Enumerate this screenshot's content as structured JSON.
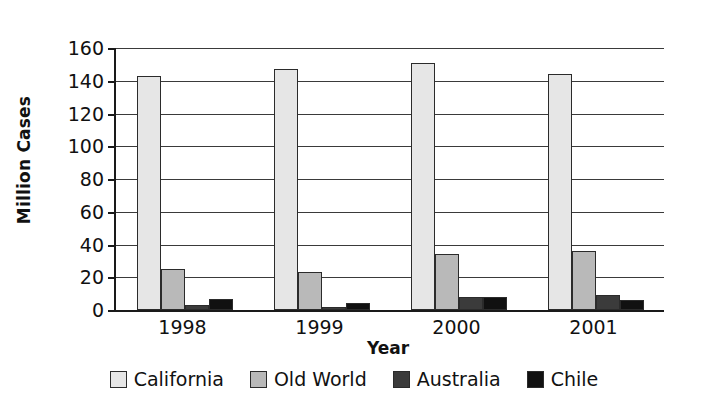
{
  "chart_data": {
    "type": "bar",
    "title": "",
    "xlabel": "Year",
    "ylabel": "Million Cases",
    "categories": [
      "1998",
      "1999",
      "2000",
      "2001"
    ],
    "series": [
      {
        "name": "California",
        "color": "#e6e6e6",
        "values": [
          143,
          147,
          151,
          144
        ]
      },
      {
        "name": "Old World",
        "color": "#b9b9b9",
        "values": [
          25,
          23,
          34,
          36
        ]
      },
      {
        "name": "Australia",
        "color": "#3b3b3b",
        "values": [
          3,
          2,
          8,
          9
        ]
      },
      {
        "name": "Chile",
        "color": "#111111",
        "values": [
          7,
          4,
          8,
          6
        ]
      }
    ],
    "ylim": [
      0,
      160
    ],
    "yticks": [
      0,
      20,
      40,
      60,
      80,
      100,
      120,
      140,
      160
    ],
    "ytick_labels": [
      "0",
      "20",
      "40",
      "60",
      "80",
      "100",
      "120",
      "140",
      "160"
    ],
    "grid": "horizontal",
    "legend_position": "bottom"
  },
  "legend": {
    "items": [
      {
        "label": "California",
        "color": "#e6e6e6"
      },
      {
        "label": "Old World",
        "color": "#b9b9b9"
      },
      {
        "label": "Australia",
        "color": "#3b3b3b"
      },
      {
        "label": "Chile",
        "color": "#111111"
      }
    ]
  }
}
